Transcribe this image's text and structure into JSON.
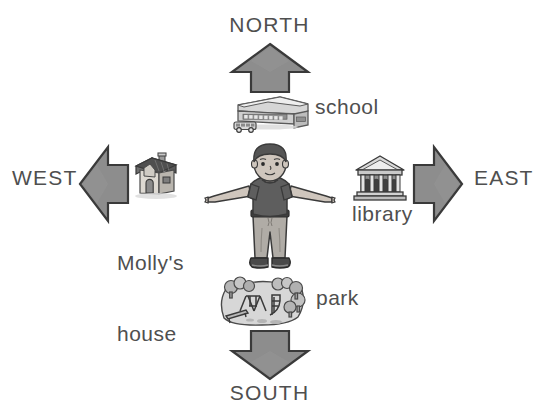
{
  "diagram": {
    "center_figure": "boy-standing-arms-out",
    "colors": {
      "arrow_fill": "#8d8d8d",
      "arrow_fill_light": "#a0a0a0",
      "arrow_stroke": "#3a3a3a",
      "text": "#4f4f4f",
      "background": "#ffffff",
      "shirt": "#5e5e5e",
      "pants": "#b0aca6",
      "hair": "#555555",
      "skin": "#cfc6bd",
      "roof_dark": "#4f4f4f",
      "grass": "#cfcfcf"
    },
    "directions": [
      {
        "key": "north",
        "label": "NORTH",
        "arrow": "arrow-up-icon"
      },
      {
        "key": "south",
        "label": "SOUTH",
        "arrow": "arrow-down-icon"
      },
      {
        "key": "east",
        "label": "EAST",
        "arrow": "arrow-right-icon"
      },
      {
        "key": "west",
        "label": "WEST",
        "arrow": "arrow-left-icon"
      }
    ],
    "places": [
      {
        "key": "school",
        "label": "school",
        "icon": "school-building-icon",
        "direction": "north"
      },
      {
        "key": "house",
        "label_line1": "Molly's",
        "label_line2": "house",
        "label": "Molly's house",
        "icon": "house-icon",
        "direction": "west"
      },
      {
        "key": "library",
        "label": "library",
        "icon": "library-building-icon",
        "direction": "east"
      },
      {
        "key": "park",
        "label": "park",
        "icon": "park-icon",
        "direction": "south"
      }
    ]
  }
}
